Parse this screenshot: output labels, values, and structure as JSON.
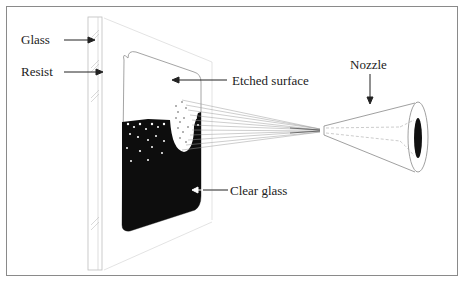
{
  "diagram": {
    "labels": {
      "glass": "Glass",
      "resist": "Resist",
      "etched_surface": "Etched surface",
      "clear_glass": "Clear glass",
      "nozzle": "Nozzle"
    },
    "colors": {
      "frame": "#8a8a8a",
      "ink": "#111111",
      "faint_line": "#b5b5b5",
      "text": "#222222"
    },
    "components": [
      "glass-pane",
      "resist-layer",
      "etched-region",
      "clear-glass-region",
      "abrasive-stream",
      "nozzle"
    ]
  }
}
